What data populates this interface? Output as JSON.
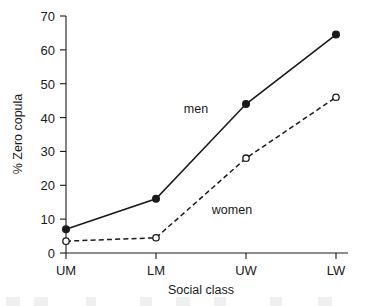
{
  "chart_data": {
    "type": "line",
    "title": "",
    "xlabel": "Social class",
    "ylabel": "% Zero copula",
    "categories": [
      "UM",
      "LM",
      "UW",
      "LW"
    ],
    "ylim": [
      0,
      70
    ],
    "yticks": [
      0,
      10,
      20,
      30,
      40,
      50,
      60,
      70
    ],
    "grid": false,
    "legend_position": "inline-annotation",
    "series": [
      {
        "name": "men",
        "values": [
          7,
          16,
          44,
          64.5
        ],
        "line_style": "solid",
        "marker": "filled-circle",
        "color": "#1a1a1a",
        "annotation": "men"
      },
      {
        "name": "women",
        "values": [
          3.5,
          4.5,
          28,
          46
        ],
        "line_style": "dashed",
        "marker": "open-circle",
        "color": "#1a1a1a",
        "annotation": "women"
      }
    ]
  },
  "annotations": {
    "men_label": "men",
    "women_label": "women"
  },
  "axis": {
    "y_label": "% Zero copula",
    "x_label": "Social class",
    "y_tick_labels": [
      "0",
      "10",
      "20",
      "30",
      "40",
      "50",
      "60",
      "70"
    ],
    "x_tick_labels": [
      "UM",
      "LM",
      "UW",
      "LW"
    ]
  },
  "colors": {
    "ink": "#1a1a1a",
    "background": "#ffffff"
  }
}
